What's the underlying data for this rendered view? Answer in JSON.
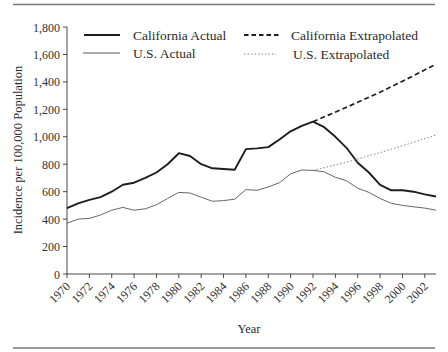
{
  "chart_data": {
    "type": "line",
    "title": "",
    "xlabel": "Year",
    "ylabel": "Incidence per 100,000 Population",
    "ylim": [
      0,
      1800
    ],
    "xlim": [
      1970,
      2003
    ],
    "grid": false,
    "legend_position": "top",
    "y_ticks": [
      0,
      200,
      400,
      600,
      800,
      1000,
      1200,
      1400,
      1600,
      1800
    ],
    "y_tick_labels": [
      "0",
      "200",
      "400",
      "600",
      "800",
      "1,000",
      "1,200",
      "1,400",
      "1,600",
      "1,800"
    ],
    "x_ticks": [
      1970,
      1972,
      1974,
      1976,
      1978,
      1980,
      1982,
      1984,
      1986,
      1988,
      1990,
      1992,
      1994,
      1996,
      1998,
      2000,
      2002
    ],
    "x_tick_labels": [
      "1970",
      "1972",
      "1974",
      "1976",
      "1978",
      "1980",
      "1982",
      "1984",
      "1986",
      "1988",
      "1990",
      "1992",
      "1994",
      "1996",
      "1998",
      "2000",
      "2002"
    ],
    "series": [
      {
        "name": "California Actual",
        "style": "solid-thick",
        "x": [
          1970,
          1971,
          1972,
          1973,
          1974,
          1975,
          1976,
          1977,
          1978,
          1979,
          1980,
          1981,
          1982,
          1983,
          1984,
          1985,
          1986,
          1987,
          1988,
          1989,
          1990,
          1991,
          1992,
          1993,
          1994,
          1995,
          1996,
          1997,
          1998,
          1999,
          2000,
          2001,
          2002,
          2003
        ],
        "values": [
          480,
          515,
          540,
          560,
          600,
          650,
          665,
          700,
          740,
          800,
          880,
          860,
          800,
          770,
          765,
          760,
          910,
          915,
          925,
          980,
          1040,
          1080,
          1110,
          1070,
          1000,
          920,
          810,
          740,
          650,
          610,
          610,
          600,
          580,
          565
        ]
      },
      {
        "name": "U.S. Actual",
        "style": "solid-thin",
        "x": [
          1970,
          1971,
          1972,
          1973,
          1974,
          1975,
          1976,
          1977,
          1978,
          1979,
          1980,
          1981,
          1982,
          1983,
          1984,
          1985,
          1986,
          1987,
          1988,
          1989,
          1990,
          1991,
          1992,
          1993,
          1994,
          1995,
          1996,
          1997,
          1998,
          1999,
          2000,
          2001,
          2002,
          2003
        ],
        "values": [
          370,
          400,
          405,
          430,
          465,
          485,
          465,
          475,
          505,
          550,
          595,
          590,
          560,
          530,
          535,
          545,
          615,
          610,
          635,
          665,
          730,
          758,
          755,
          745,
          705,
          680,
          625,
          595,
          550,
          515,
          500,
          490,
          480,
          465
        ]
      },
      {
        "name": "California Extrapolated",
        "style": "dashed",
        "x": [
          1992,
          1995,
          1998,
          2001,
          2003
        ],
        "values": [
          1110,
          1215,
          1325,
          1445,
          1530
        ]
      },
      {
        "name": "U.S. Extrapolated",
        "style": "dotted",
        "x": [
          1992,
          1995,
          1998,
          2001,
          2003
        ],
        "values": [
          755,
          815,
          885,
          960,
          1013
        ]
      }
    ],
    "legend": [
      {
        "label": "California Actual",
        "style": "solid-thick"
      },
      {
        "label": "California Extrapolated",
        "style": "dashed"
      },
      {
        "label": "U.S. Actual",
        "style": "solid-thin"
      },
      {
        "label": "U.S. Extrapolated",
        "style": "dotted"
      }
    ]
  },
  "colors": {
    "california_line": "#1e1e1e",
    "us_line": "#555555",
    "extrap_ca": "#1e1e1e",
    "extrap_us": "#777777",
    "rule": "#777777",
    "text": "#2a2a2a"
  }
}
